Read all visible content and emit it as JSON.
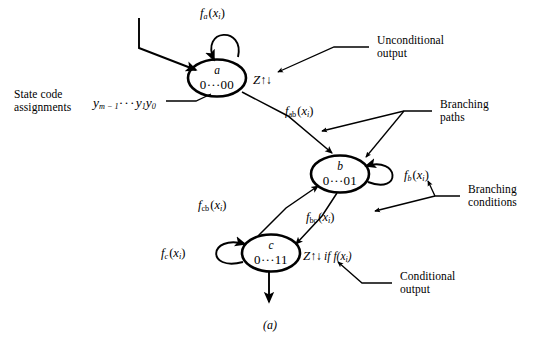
{
  "figure": {
    "caption": "(a)",
    "type": "state-transition-diagram"
  },
  "states": [
    {
      "id": "a",
      "name": "a",
      "code": "0···00",
      "self_loop_label": "f_a(x_i)",
      "output": "Z↑↓",
      "output_z": "Z",
      "output_arrows": "↑↓",
      "output_condition": ""
    },
    {
      "id": "b",
      "name": "b",
      "code": "0···01",
      "self_loop_label": "f_b(x_i)",
      "output": "",
      "output_z": "",
      "output_arrows": "",
      "output_condition": ""
    },
    {
      "id": "c",
      "name": "c",
      "code": "0···11",
      "self_loop_label": "f_c(x_i)",
      "output": "Z↑↓ if f(x_i)",
      "output_z": "Z",
      "output_arrows": "↑↓",
      "output_condition": "if",
      "output_condition_fn": "f",
      "output_condition_arg": "(x_i)"
    }
  ],
  "transitions": [
    {
      "from": "a",
      "to": "b",
      "label_fn": "f",
      "label_sub": "ab",
      "label_arg": "(x_i)"
    },
    {
      "from": "b",
      "to": "c",
      "label_fn": "f",
      "label_sub": "bc",
      "label_arg": "(x_i)"
    },
    {
      "from": "c",
      "to": "b",
      "label_fn": "f",
      "label_sub": "cb",
      "label_arg": "(x_i)"
    }
  ],
  "self_loops": [
    {
      "state": "a",
      "fn": "f",
      "sub": "a",
      "arg": "(x_i)"
    },
    {
      "state": "b",
      "fn": "f",
      "sub": "b",
      "arg": "(x_i)"
    },
    {
      "state": "c",
      "fn": "f",
      "sub": "c",
      "arg": "(x_i)"
    }
  ],
  "annotations": [
    {
      "id": "unconditional-output",
      "line1": "Unconditional",
      "line2": "output"
    },
    {
      "id": "branching-paths",
      "line1": "Branching",
      "line2": "paths"
    },
    {
      "id": "branching-conditions",
      "line1": "Branching",
      "line2": "conditions"
    },
    {
      "id": "conditional-output",
      "line1": "Conditional",
      "line2": "output"
    },
    {
      "id": "state-code-assignments",
      "line1": "State code",
      "line2": "assignments"
    }
  ],
  "state_code_variable": {
    "prefix": "y",
    "sub_first": "m − 1",
    "dots": "···",
    "mid": "y",
    "sub_mid": "1",
    "last": "y",
    "sub_last": "0",
    "full": "y_{m-1}···y_1y_0"
  },
  "colors": {
    "ink": "#000000",
    "background": "#ffffff"
  }
}
